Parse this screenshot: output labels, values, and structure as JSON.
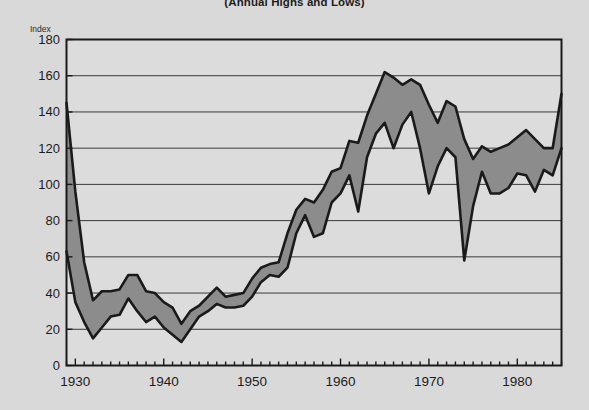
{
  "title": "(Annual Highs and Lows)",
  "axis_unit_label": "Index",
  "colors": {
    "background": "#d9d9d9",
    "plot_background": "#dcdcdc",
    "band_fill": "#8c8c8c",
    "line": "#1a1a1a",
    "gridline": "#3a3a3a",
    "frame": "#1a1a1a",
    "text": "#1c1c1c"
  },
  "chart_data": {
    "type": "area",
    "title": "(Annual Highs and Lows)",
    "subtitle": "",
    "xlabel": "",
    "ylabel": "Index",
    "ylim": [
      0,
      180
    ],
    "xlim": [
      1929,
      1985
    ],
    "grid": true,
    "legend": false,
    "y_ticks": [
      0,
      20,
      40,
      60,
      80,
      100,
      120,
      140,
      160,
      180
    ],
    "x_ticks": [
      1930,
      1940,
      1950,
      1960,
      1970,
      1980
    ],
    "x_minor_tick_interval": 1,
    "x": [
      1929,
      1930,
      1931,
      1932,
      1933,
      1934,
      1935,
      1936,
      1937,
      1938,
      1939,
      1940,
      1941,
      1942,
      1943,
      1944,
      1945,
      1946,
      1947,
      1948,
      1949,
      1950,
      1951,
      1952,
      1953,
      1954,
      1955,
      1956,
      1957,
      1958,
      1959,
      1960,
      1961,
      1962,
      1963,
      1964,
      1965,
      1966,
      1967,
      1968,
      1969,
      1970,
      1971,
      1972,
      1973,
      1974,
      1975,
      1976,
      1977,
      1978,
      1979,
      1980,
      1981,
      1982,
      1983,
      1984,
      1985
    ],
    "series": [
      {
        "name": "Annual High",
        "values": [
          145,
          96,
          57,
          36,
          41,
          41,
          42,
          50,
          50,
          41,
          40,
          35,
          32,
          23,
          30,
          33,
          38,
          43,
          38,
          39,
          40,
          48,
          54,
          56,
          57,
          73,
          86,
          92,
          90,
          97,
          107,
          109,
          124,
          123,
          138,
          150,
          162,
          159,
          155,
          158,
          155,
          144,
          134,
          146,
          143,
          125,
          114,
          121,
          118,
          120,
          122,
          126,
          130,
          125,
          120,
          120,
          150
        ]
      },
      {
        "name": "Annual Low",
        "values": [
          63,
          35,
          24,
          15,
          21,
          27,
          28,
          37,
          30,
          24,
          27,
          21,
          17,
          13,
          20,
          27,
          30,
          34,
          32,
          32,
          33,
          38,
          46,
          50,
          49,
          54,
          73,
          83,
          71,
          73,
          90,
          95,
          105,
          85,
          115,
          128,
          134,
          120,
          133,
          140,
          120,
          95,
          110,
          120,
          115,
          58,
          88,
          107,
          95,
          95,
          98,
          106,
          105,
          96,
          108,
          105,
          120
        ]
      }
    ]
  }
}
